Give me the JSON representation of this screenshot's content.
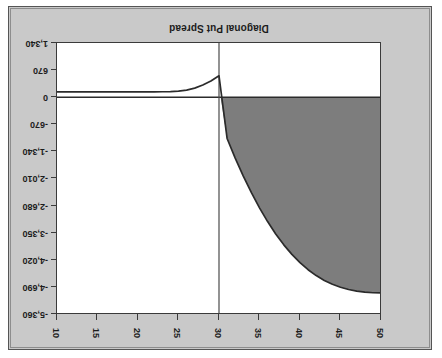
{
  "chart_data": {
    "type": "area",
    "title": "Diagonal Put Spread",
    "xlabel": "",
    "ylabel": "",
    "orientation": "rotated-180",
    "grid": false,
    "legend": null,
    "xticks": [
      50,
      45,
      40,
      35,
      30,
      25,
      20,
      15,
      10
    ],
    "xtick_labels": [
      "50",
      "45",
      "40",
      "35",
      "30",
      "25",
      "20",
      "15",
      "10"
    ],
    "xlim": [
      50,
      10
    ],
    "yticks": [
      -5360,
      -4690,
      -4020,
      -3350,
      -2680,
      -2010,
      -1340,
      -670,
      0,
      670,
      1340
    ],
    "ytick_labels": [
      "-5,360",
      "-4,690",
      "-4,020",
      "-3,350",
      "-2,680",
      "-2,010",
      "-1,340",
      "-670",
      "0",
      "670",
      "1,340"
    ],
    "ylim": [
      -5360,
      1340
    ],
    "zero_line": 0,
    "vertical_marker_x": 30,
    "fill_color": "#7d7d7d",
    "line_color": "#2b2b2b",
    "plot_bg": "#ffffff",
    "figure_bg": "#c9c9c9",
    "series": [
      {
        "name": "Diagonal Put Spread P/L",
        "x": [
          50,
          49,
          48,
          47,
          46,
          45,
          44,
          43,
          42,
          41,
          40,
          39,
          38,
          37,
          36,
          35,
          34,
          33,
          32,
          31,
          30,
          29,
          28,
          27,
          26,
          25,
          24,
          23,
          22,
          21,
          20,
          18,
          16,
          14,
          12,
          10
        ],
        "values": [
          -4840,
          -4835,
          -4820,
          -4795,
          -4755,
          -4700,
          -4625,
          -4530,
          -4410,
          -4265,
          -4090,
          -3885,
          -3650,
          -3380,
          -3075,
          -2735,
          -2360,
          -1950,
          -1505,
          -1020,
          530,
          400,
          300,
          225,
          175,
          150,
          140,
          135,
          132,
          130,
          130,
          130,
          130,
          130,
          130,
          130
        ]
      }
    ],
    "regions": [
      {
        "name": "profit-shaded-region",
        "from_x": 50,
        "to_x": 30.2,
        "description": "gray filled area between curve and zero line"
      }
    ]
  },
  "title_text": "Diagonal Put Spread"
}
